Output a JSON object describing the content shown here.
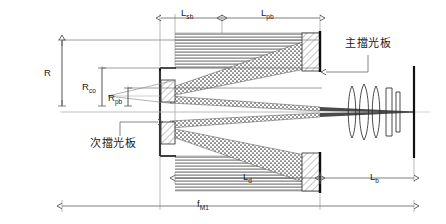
{
  "diagram": {
    "background_color": "#ffffff",
    "line_color": "#1a1a1a",
    "dim_line_color": "#555555",
    "beam_color": "#4a4a4a",
    "hatch_color": "#808080",
    "labels": {
      "radius_full": {
        "base": "R",
        "sub": ""
      },
      "radius_co": {
        "base": "R",
        "sub": "co"
      },
      "radius_pb": {
        "base": "R",
        "sub": "pb"
      },
      "length_sb": {
        "base": "L",
        "sub": "sb"
      },
      "length_pb": {
        "base": "L",
        "sub": "pb"
      },
      "length_d": {
        "base": "L",
        "sub": "d"
      },
      "length_b": {
        "base": "L",
        "sub": "b"
      },
      "focal_m1": {
        "base": "f",
        "sub": "M1"
      },
      "main_baffle": "主擋光板",
      "secondary_baffle": "次擋光板"
    },
    "elements": [
      "primary-mirror",
      "secondary-baffle",
      "main-baffle",
      "lens-group",
      "image-plane",
      "collimated-beam",
      "converging-beam"
    ],
    "lens_count": 5
  }
}
